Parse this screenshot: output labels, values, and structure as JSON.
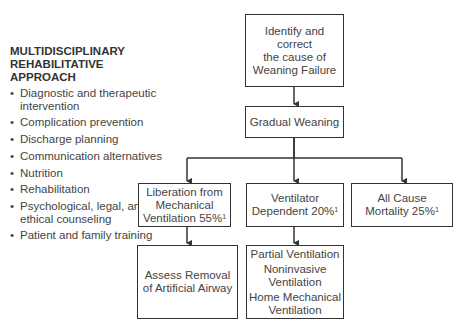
{
  "sidebar": {
    "title_lines": [
      "MULTIDISCIPLINARY",
      "REHABILITATIVE",
      "APPROACH"
    ],
    "bullet_glyph": "•",
    "items": [
      {
        "label": "Diagnostic and therapeutic intervention"
      },
      {
        "label": "Complication prevention"
      },
      {
        "label": "Discharge planning"
      },
      {
        "label": "Communication alternatives"
      },
      {
        "label": "Nutrition"
      },
      {
        "label": "Rehabilitation"
      },
      {
        "label": "Psychological, legal, and ethical counseling"
      },
      {
        "label": "Patient and family training"
      }
    ]
  },
  "flowchart": {
    "identify": {
      "line1": "Identify and correct",
      "line2": "the cause of",
      "line3": "Weaning Failure"
    },
    "gradual": {
      "label": "Gradual Weaning"
    },
    "liberation": {
      "line1": "Liberation from",
      "line2": "Mechanical",
      "line3": "Ventilation 55%",
      "sup": "1"
    },
    "dependent": {
      "line1": "Ventilator",
      "line2": "Dependent 20%",
      "sup": "1"
    },
    "mortality": {
      "line1": "All Cause",
      "line2": "Mortality 25%",
      "sup": "1"
    },
    "assess": {
      "line1": "Assess Removal",
      "line2": "of Artificial Airway"
    },
    "options": {
      "items": [
        "Partial Ventilation",
        "Noninvasive Ventilation",
        "Home Mechanical Ventilation"
      ]
    }
  },
  "colors": {
    "line": "#333333",
    "text": "#444444",
    "background": "#ffffff"
  }
}
